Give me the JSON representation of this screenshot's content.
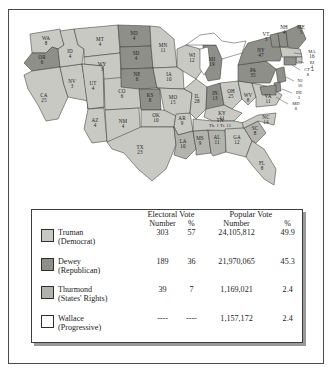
{
  "figure": {
    "colors": {
      "truman": "#c9c9c4",
      "dewey": "#8f8f8a",
      "thurmond": "#b3b3ad",
      "wallace": "#ffffff",
      "water": "#ffffff",
      "border": "#3d3d3d",
      "shadow": "#9a9a9a"
    }
  },
  "map": {
    "name": "united-states-electoral-map-1948",
    "states": [
      {
        "code": "WA",
        "votes": "8",
        "winner": "truman"
      },
      {
        "code": "OR",
        "votes": "6",
        "winner": "dewey"
      },
      {
        "code": "CA",
        "votes": "25",
        "winner": "truman"
      },
      {
        "code": "NV",
        "votes": "3",
        "winner": "truman"
      },
      {
        "code": "ID",
        "votes": "4",
        "winner": "truman"
      },
      {
        "code": "MT",
        "votes": "4",
        "winner": "truman"
      },
      {
        "code": "WY",
        "votes": "3",
        "winner": "truman"
      },
      {
        "code": "UT",
        "votes": "4",
        "winner": "truman"
      },
      {
        "code": "AZ",
        "votes": "4",
        "winner": "truman"
      },
      {
        "code": "CO",
        "votes": "6",
        "winner": "truman"
      },
      {
        "code": "NM",
        "votes": "4",
        "winner": "truman"
      },
      {
        "code": "ND",
        "votes": "4",
        "winner": "dewey"
      },
      {
        "code": "SD",
        "votes": "4",
        "winner": "dewey"
      },
      {
        "code": "NE",
        "votes": "6",
        "winner": "dewey"
      },
      {
        "code": "KS",
        "votes": "8",
        "winner": "dewey"
      },
      {
        "code": "OK",
        "votes": "10",
        "winner": "truman"
      },
      {
        "code": "TX",
        "votes": "23",
        "winner": "truman"
      },
      {
        "code": "MN",
        "votes": "11",
        "winner": "truman"
      },
      {
        "code": "IA",
        "votes": "10",
        "winner": "truman"
      },
      {
        "code": "MO",
        "votes": "15",
        "winner": "truman"
      },
      {
        "code": "AR",
        "votes": "9",
        "winner": "truman"
      },
      {
        "code": "LA",
        "votes": "10",
        "winner": "thurmond"
      },
      {
        "code": "WI",
        "votes": "12",
        "winner": "truman"
      },
      {
        "code": "IL",
        "votes": "28",
        "winner": "truman"
      },
      {
        "code": "MS",
        "votes": "9",
        "winner": "thurmond"
      },
      {
        "code": "AL",
        "votes": "11",
        "winner": "thurmond"
      },
      {
        "code": "MI",
        "votes": "19",
        "winner": "dewey"
      },
      {
        "code": "IN",
        "votes": "13",
        "winner": "dewey"
      },
      {
        "code": "OH",
        "votes": "25",
        "winner": "truman"
      },
      {
        "code": "KY",
        "votes": "11",
        "winner": "truman"
      },
      {
        "code": "GA",
        "votes": "12",
        "winner": "truman"
      },
      {
        "code": "FL",
        "votes": "8",
        "winner": "truman"
      },
      {
        "code": "SC",
        "votes": "8",
        "winner": "thurmond"
      },
      {
        "code": "NC",
        "votes": "14",
        "winner": "truman"
      },
      {
        "code": "WV",
        "votes": "8",
        "winner": "truman"
      },
      {
        "code": "VA",
        "votes": "11",
        "winner": "truman"
      },
      {
        "code": "PA",
        "votes": "35",
        "winner": "dewey"
      },
      {
        "code": "NY",
        "votes": "47",
        "winner": "dewey"
      },
      {
        "code": "VT",
        "votes": "3",
        "winner": "dewey"
      },
      {
        "code": "NH",
        "votes": "4",
        "winner": "dewey"
      },
      {
        "code": "ME",
        "votes": "5",
        "winner": "dewey"
      },
      {
        "code": "MA",
        "votes": "16",
        "winner": "truman"
      },
      {
        "code": "RI",
        "votes": "4",
        "winner": "truman"
      },
      {
        "code": "CT",
        "votes": "8",
        "winner": "dewey"
      },
      {
        "code": "NJ",
        "votes": "16",
        "winner": "dewey"
      },
      {
        "code": "DE",
        "votes": "3",
        "winner": "dewey"
      },
      {
        "code": "MD",
        "votes": "8",
        "winner": "dewey"
      }
    ],
    "split_state": {
      "code": "TN",
      "parts": [
        {
          "abbr": "Th.",
          "votes": "1"
        },
        {
          "abbr": "Tr.",
          "votes": "11"
        }
      ]
    }
  },
  "table": {
    "group_headers": {
      "electoral": "Electoral Vote",
      "popular": "Popular Vote"
    },
    "sub_headers": {
      "electoral_number": "Number",
      "electoral_percent": "%",
      "popular_number": "Number",
      "popular_percent": "%"
    },
    "rows": [
      {
        "candidate": "Truman",
        "party": "(Democrat)",
        "swatch": "truman",
        "electoral_number": "303",
        "electoral_percent": "57",
        "popular_number": "24,105,812",
        "popular_percent": "49.9"
      },
      {
        "candidate": "Dewey",
        "party": "(Republican)",
        "swatch": "dewey",
        "electoral_number": "189",
        "electoral_percent": "36",
        "popular_number": "21,970,065",
        "popular_percent": "45.3"
      },
      {
        "candidate": "Thurmond",
        "party": "(States' Rights)",
        "swatch": "thurmond",
        "electoral_number": "39",
        "electoral_percent": "7",
        "popular_number": "1,169,021",
        "popular_percent": "2.4"
      },
      {
        "candidate": "Wallace",
        "party": "(Progressive)",
        "swatch": "wallace",
        "electoral_number": "----",
        "electoral_percent": "----",
        "popular_number": "1,157,172",
        "popular_percent": "2.4"
      }
    ]
  }
}
